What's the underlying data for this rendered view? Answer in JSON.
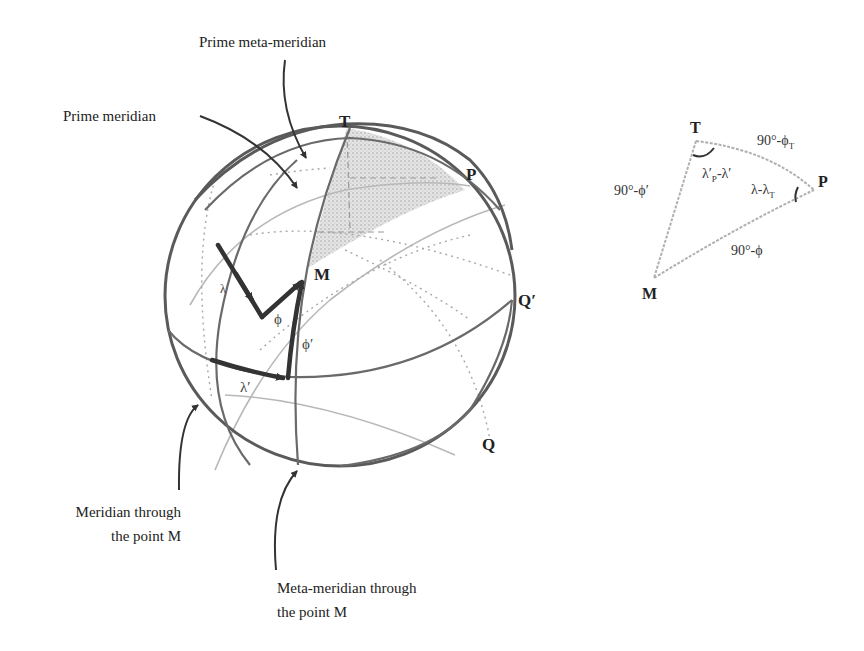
{
  "figure": {
    "callouts": {
      "prime_meta_meridian": "Prime meta-meridian",
      "prime_meridian": "Prime meridian",
      "meridian_through_m_line1": "Meridian through",
      "meridian_through_m_line2": "the point M",
      "meta_meridian_through_m_line1": "Meta-meridian through",
      "meta_meridian_through_m_line2": "the point M"
    },
    "sphere_points": {
      "T": "T",
      "P": "P",
      "M": "M",
      "Q_prime": "Q′",
      "Q": "Q"
    },
    "sphere_symbols": {
      "phi": "ϕ",
      "phi_prime": "ϕ′",
      "lambda": "λ",
      "lambda_prime": "λ′"
    },
    "triangle": {
      "vertices": {
        "T": "T",
        "P": "P",
        "M": "M"
      },
      "sides": {
        "TP": "90°-ϕ",
        "TP_sub": "T",
        "TM": "90°-ϕ′",
        "PM": "90°-ϕ"
      },
      "angles": {
        "at_T_main": "λ′",
        "at_T_sub": "P",
        "at_T_rest": "-λ′",
        "at_P_main": "λ-λ",
        "at_P_sub": "T"
      }
    },
    "colors": {
      "stroke_dark": "#333333",
      "stroke_sphere": "#5a5a5a",
      "shading": "#cfcfcf",
      "faint": "#b8b8b8"
    }
  }
}
